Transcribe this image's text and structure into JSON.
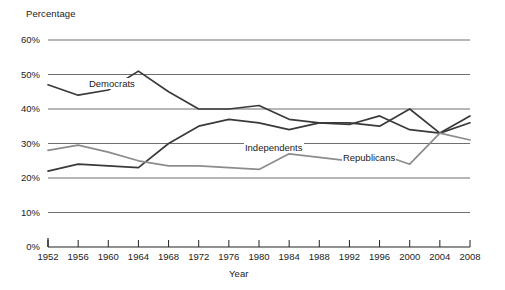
{
  "chart_data": {
    "type": "line",
    "title": "",
    "xlabel": "Year",
    "ylabel": "Percentage",
    "x": [
      1952,
      1956,
      1960,
      1964,
      1968,
      1972,
      1976,
      1980,
      1984,
      1988,
      1992,
      1996,
      2000,
      2004,
      2008
    ],
    "categories": [
      "1952",
      "1956",
      "1960",
      "1964",
      "1968",
      "1972",
      "1976",
      "1980",
      "1984",
      "1988",
      "1992",
      "1996",
      "2000",
      "2004",
      "2008"
    ],
    "ylim": [
      0,
      60
    ],
    "yticks": [
      0,
      10,
      20,
      30,
      40,
      50,
      60
    ],
    "ytick_labels": [
      "0%",
      "10%",
      "20%",
      "30%",
      "40%",
      "50%",
      "60%"
    ],
    "grid": "horizontal",
    "legend": "inline-labels",
    "series": [
      {
        "name": "Democrats",
        "color": "#3a3a3a",
        "label_x": 1957.3,
        "label_y": 47.2,
        "values": [
          47.0,
          44.0,
          45.5,
          51.0,
          45.0,
          40.0,
          40.0,
          41.0,
          37.0,
          36.0,
          35.5,
          38.0,
          34.0,
          33.0,
          36.0
        ]
      },
      {
        "name": "Independents",
        "color": "#3a3a3a",
        "label_x": 1978.0,
        "label_y": 28.8,
        "values": [
          22.0,
          24.0,
          23.5,
          23.0,
          30.0,
          35.0,
          37.0,
          36.0,
          34.0,
          36.0,
          36.0,
          35.0,
          40.0,
          33.0,
          38.0
        ]
      },
      {
        "name": "Republicans",
        "color": "#8c8c8c",
        "label_x": 1991.0,
        "label_y": 25.8,
        "values": [
          28.0,
          29.5,
          27.5,
          25.0,
          23.5,
          23.5,
          23.0,
          22.5,
          27.0,
          26.0,
          25.0,
          27.0,
          24.0,
          33.0,
          31.0
        ]
      }
    ]
  },
  "axis": {
    "y_title": "Percentage",
    "x_title": "Year"
  }
}
